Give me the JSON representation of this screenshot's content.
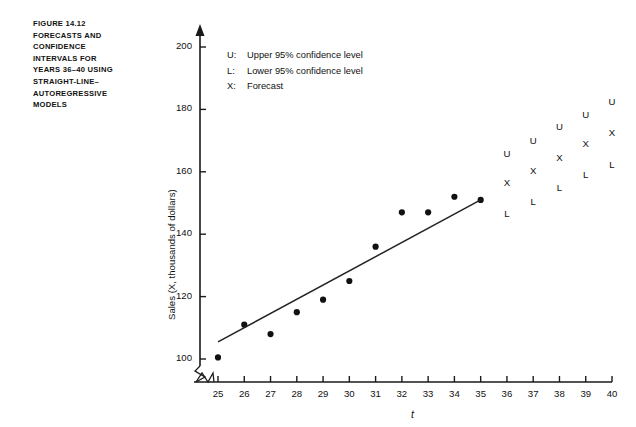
{
  "figure": {
    "caption_lines": [
      "FIGURE 14.12",
      "FORECASTS AND",
      "CONFIDENCE",
      "INTERVALS FOR",
      "YEARS 36–40 USING",
      "STRAIGHT-LINE–",
      "AUTOREGRESSIVE",
      "MODELS"
    ]
  },
  "legend": {
    "position": "inside-top-left",
    "entries": [
      {
        "key": "U:",
        "text": "Upper 95% confidence level"
      },
      {
        "key": "L:",
        "text": "Lower 95% confidence level"
      },
      {
        "key": "X:",
        "text": "Forecast"
      }
    ]
  },
  "chart_data": {
    "type": "scatter",
    "xlabel": "t",
    "ylabel": "Sales (X, thousands of dollars)",
    "xlim": [
      25,
      40
    ],
    "ylim": [
      100,
      200
    ],
    "y_axis_break": true,
    "grid": false,
    "xticks": [
      25,
      26,
      27,
      28,
      29,
      30,
      31,
      32,
      33,
      34,
      35,
      36,
      37,
      38,
      39,
      40
    ],
    "xtick_labels": [
      "25",
      "26",
      "27",
      "28",
      "29",
      "30",
      "31",
      "32",
      "33",
      "34",
      "35",
      "36",
      "37",
      "38",
      "39",
      "40"
    ],
    "yticks": [
      100,
      120,
      140,
      160,
      180,
      200
    ],
    "ytick_labels": [
      "100",
      "120",
      "140",
      "160",
      "180",
      "200"
    ],
    "series": [
      {
        "name": "Observed sales",
        "marker": "filled-circle",
        "x": [
          25,
          26,
          27,
          28,
          29,
          30,
          31,
          32,
          33,
          34,
          35
        ],
        "values": [
          100.5,
          111,
          108,
          115,
          119,
          125,
          136,
          147,
          147,
          152,
          151
        ]
      },
      {
        "name": "Fitted straight-line trend",
        "marker": "line",
        "x": [
          25,
          35
        ],
        "values": [
          105.5,
          151
        ]
      },
      {
        "name": "Forecast (X)",
        "marker": "X",
        "x": [
          36,
          37,
          38,
          39,
          40
        ],
        "values": [
          156,
          160,
          164,
          168.5,
          172
        ]
      },
      {
        "name": "Upper 95% confidence level (U)",
        "marker": "U",
        "x": [
          36,
          37,
          38,
          39,
          40
        ],
        "values": [
          165.5,
          169.5,
          174,
          178,
          182
        ]
      },
      {
        "name": "Lower 95% confidence level (L)",
        "marker": "L",
        "x": [
          36,
          37,
          38,
          39,
          40
        ],
        "values": [
          146,
          150,
          154.5,
          158.5,
          162
        ]
      }
    ]
  },
  "colors": {
    "ink": "#1a1a1a",
    "background": "#ffffff",
    "marker": "#111111",
    "trendline": "#222222"
  }
}
